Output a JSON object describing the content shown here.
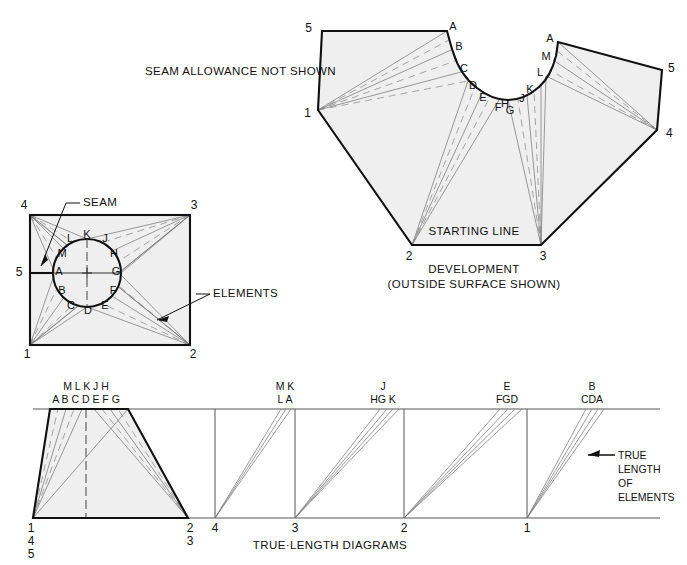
{
  "figure": {
    "notes": {
      "seam_allowance": "SEAM ALLOWANCE NOT SHOWN",
      "starting_line": "STARTING LINE",
      "development_title": "DEVELOPMENT",
      "development_subtitle": "(OUTSIDE SURFACE SHOWN)",
      "true_length_title": "TRUE·LENGTH DIAGRAMS",
      "seam_callout": "SEAM",
      "elements_callout": "ELEMENTS",
      "true_length_callout_lines": [
        "TRUE",
        "LENGTH",
        "OF",
        "ELEMENTS"
      ]
    },
    "plan_view": {
      "name": "transition-piece-plan-view",
      "corner_labels": [
        "4",
        "3",
        "5",
        "1",
        "2"
      ],
      "corners": {
        "top_left": "4",
        "top_right": "3",
        "left_mid": "5",
        "bottom_left": "1",
        "bottom_right": "2"
      },
      "circle_labels": [
        "A",
        "B",
        "C",
        "D",
        "E",
        "F",
        "G",
        "H",
        "J",
        "K",
        "L",
        "M"
      ]
    },
    "development_view": {
      "name": "pattern-development",
      "outer_labels": [
        "5",
        "1",
        "2",
        "3",
        "4",
        "5"
      ],
      "left_arc_labels": [
        "A",
        "B",
        "C",
        "D",
        "E",
        "F",
        "G"
      ],
      "right_arc_labels": [
        "A",
        "M",
        "L",
        "K",
        "J",
        "H",
        "G"
      ],
      "bottom_labels": [
        "2",
        "3"
      ]
    },
    "true_length_diagrams": {
      "name": "true-length-diagrams",
      "baseline_labels": [
        "1",
        "4",
        "5",
        "2",
        "3",
        "4",
        "3",
        "2",
        "1"
      ],
      "base_ticks": [
        "4",
        "3",
        "2",
        "1"
      ],
      "trapezoid_origin_labels": [
        "1",
        "4",
        "5"
      ],
      "trapezoid_right_labels": [
        "2",
        "3"
      ],
      "panels": [
        {
          "top_row": "M L   K   J H",
          "bottom_row": "A B C   D   E F G"
        },
        {
          "top_row": "M K",
          "bottom_row": "L A"
        },
        {
          "top_row": "J",
          "bottom_row": "HG K"
        },
        {
          "top_row": "E",
          "bottom_row": "FGD"
        },
        {
          "top_row": "B",
          "bottom_row": "CDA"
        }
      ]
    },
    "colors": {
      "outline": "#111111",
      "fill": "#efefef",
      "element_line": "#7a7a7a",
      "background": "#ffffff"
    }
  }
}
